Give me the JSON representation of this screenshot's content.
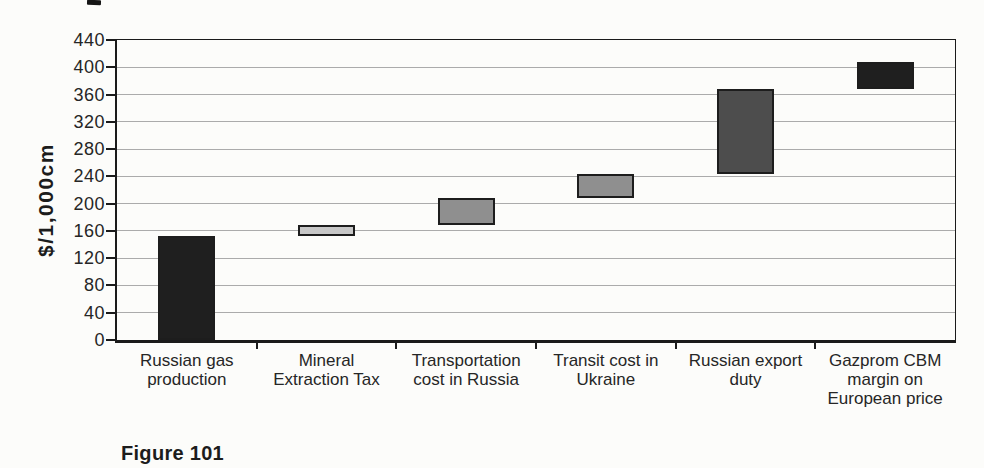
{
  "page": {
    "background": "#fcfcfa"
  },
  "figure_caption": "Figure 101",
  "chart_data": {
    "type": "bar",
    "subtype": "waterfall-floating-bars",
    "title": "",
    "xlabel": "",
    "ylabel": "$/1,000cm",
    "ylim": [
      0,
      440
    ],
    "yticks": [
      0,
      40,
      80,
      120,
      160,
      200,
      240,
      280,
      320,
      360,
      400,
      440
    ],
    "grid": "horizontal-light",
    "legend": "none",
    "categories": [
      "Russian gas production",
      "Mineral Extraction Tax",
      "Transportation cost in Russia",
      "Transit cost in Ukraine",
      "Russian export duty",
      "Gazprom CBM margin on European price"
    ],
    "category_label_lines": [
      [
        "Russian gas",
        "production"
      ],
      [
        "Mineral",
        "Extraction Tax"
      ],
      [
        "Transportation",
        "cost in Russia"
      ],
      [
        "Transit cost in",
        "Ukraine"
      ],
      [
        "Russian export",
        "duty"
      ],
      [
        "Gazprom CBM",
        "margin on",
        "European price"
      ]
    ],
    "bars": [
      {
        "category": "Russian gas production",
        "start": 0,
        "end": 152,
        "fill": "#1f1f1f"
      },
      {
        "category": "Mineral Extraction Tax",
        "start": 152,
        "end": 168,
        "fill": "#c7c7c7"
      },
      {
        "category": "Transportation cost in Russia",
        "start": 168,
        "end": 208,
        "fill": "#8f8f8f"
      },
      {
        "category": "Transit cost in Ukraine",
        "start": 208,
        "end": 244,
        "fill": "#8f8f8f"
      },
      {
        "category": "Russian export duty",
        "start": 244,
        "end": 368,
        "fill": "#4d4d4d"
      },
      {
        "category": "Gazprom CBM margin on European price",
        "start": 368,
        "end": 408,
        "fill": "#1f1f1f"
      }
    ],
    "colors": {
      "bar_border": "#1d1d1d",
      "axis": "#1a1a1a",
      "gridline": "#ababab",
      "text": "#262626"
    }
  }
}
